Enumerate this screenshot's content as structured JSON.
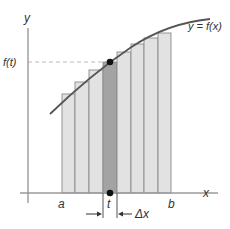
{
  "diagram": {
    "axes": {
      "x_label": "x",
      "y_label": "y",
      "origin": [
        28,
        193
      ],
      "x_end": 218,
      "y_top": 16
    },
    "curve_label": "y = f(x)",
    "f_t_label": "f(t)",
    "t_label": "t",
    "a_label": "a",
    "b_label": "b",
    "delta_x_label": "Δx",
    "colors": {
      "axis": "#9a9a9a",
      "curve": "#555555",
      "bar_fill": "#e2e2e2",
      "bar_stroke": "#8a8a8a",
      "highlight_fill": "#a3a3a3",
      "point": "#111111",
      "dashed": "#aaaaaa",
      "text": "#333333"
    },
    "bars": [
      {
        "x0": 62,
        "x1": 75,
        "top": 94,
        "highlight": false
      },
      {
        "x0": 75,
        "x1": 89,
        "top": 82,
        "highlight": false
      },
      {
        "x0": 89,
        "x1": 103,
        "top": 70,
        "highlight": false
      },
      {
        "x0": 103,
        "x1": 117,
        "top": 62,
        "highlight": true
      },
      {
        "x0": 117,
        "x1": 131,
        "top": 52,
        "highlight": false
      },
      {
        "x0": 131,
        "x1": 144,
        "top": 44,
        "highlight": false
      },
      {
        "x0": 144,
        "x1": 158,
        "top": 38,
        "highlight": false
      },
      {
        "x0": 158,
        "x1": 171,
        "top": 33,
        "highlight": false
      }
    ],
    "point_t": {
      "x": 110,
      "y": 62
    },
    "point_t_axis": {
      "x": 110,
      "y": 193
    }
  }
}
